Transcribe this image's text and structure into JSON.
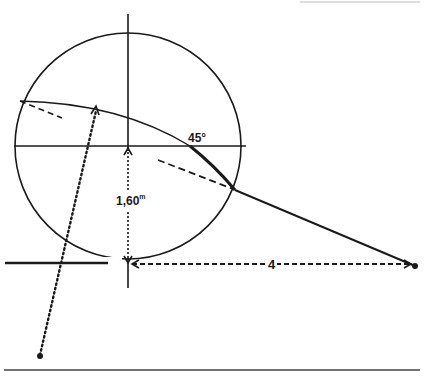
{
  "diagram": {
    "labels": {
      "height_value": "1,60",
      "height_unit": "m",
      "angle": "45°",
      "distance": "4"
    },
    "colors": {
      "stroke": "#1a1a1a",
      "background": "#ffffff"
    },
    "elements": [
      "circle",
      "vertical-axis",
      "horizontal-diameter",
      "ground-line",
      "trajectory-arc",
      "trajectory-line",
      "dashed-tangent-left",
      "dashed-tangent-right",
      "dotted-line",
      "height-arrow",
      "distance-arrow",
      "endpoint-right",
      "endpoint-bottom",
      "bottom-rule"
    ]
  }
}
